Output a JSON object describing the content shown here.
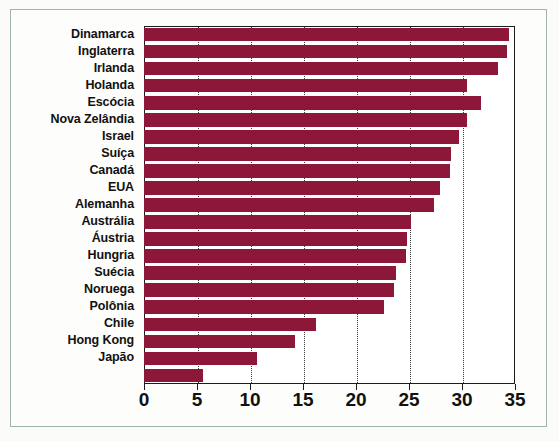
{
  "figure": {
    "background_color": "#fdfdfb",
    "frame_color": "#9fb5ad",
    "bar_color": "#8d1739",
    "axis_color": "#1c1c1c"
  },
  "chart_data": {
    "type": "bar",
    "orientation": "horizontal",
    "title": "",
    "subtitle": "",
    "xlabel": "",
    "ylabel": "",
    "xlim": [
      0,
      35
    ],
    "ylim": null,
    "grid": true,
    "grid_axis": "x",
    "grid_style": "dotted",
    "legend": false,
    "legend_position": "none",
    "xticks": [
      0,
      5,
      10,
      15,
      20,
      25,
      30,
      35
    ],
    "xtick_labels": [
      "0",
      "5",
      "10",
      "15",
      "20",
      "25",
      "30",
      "35"
    ],
    "categories": [
      "Dinamarca",
      "Inglaterra",
      "Irlanda",
      "Holanda",
      "Escócia",
      "Nova Zelândia",
      "Israel",
      "Suíça",
      "Canadá",
      "EUA",
      "Alemanha",
      "Austrália",
      "Áustria",
      "Hungria",
      "Suécia",
      "Noruega",
      "Polônia",
      "Chile",
      "Hong Kong",
      "Japão",
      ""
    ],
    "values": [
      34.4,
      34.2,
      33.4,
      30.5,
      31.8,
      30.5,
      29.7,
      29.0,
      28.9,
      27.9,
      27.4,
      25.2,
      24.8,
      24.7,
      23.8,
      23.6,
      22.6,
      16.2,
      14.2,
      10.7,
      5.6
    ],
    "series": [
      {
        "name": "",
        "color": "#8d1739",
        "values": [
          34.4,
          34.2,
          33.4,
          30.5,
          31.8,
          30.5,
          29.7,
          29.0,
          28.9,
          27.9,
          27.4,
          25.2,
          24.8,
          24.7,
          23.8,
          23.6,
          22.6,
          16.2,
          14.2,
          10.7,
          5.6
        ]
      }
    ],
    "annotations": []
  }
}
